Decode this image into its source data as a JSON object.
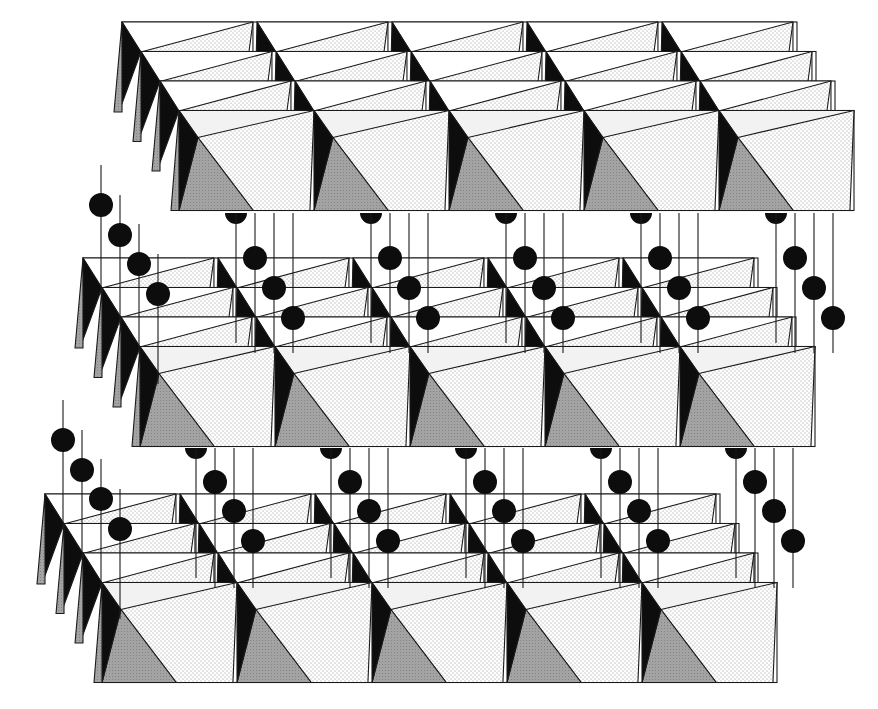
{
  "colors": {
    "background": "#ffffff",
    "outline": "#1a1a1a",
    "face_light": "#f2f2f2",
    "face_dotted_bg": "#ffffff",
    "face_dotted_dot": "#8a8a8a",
    "face_mid": "#a8a8a8",
    "face_dark": "#0d0d0d",
    "cation": "#0d0d0d"
  },
  "geometry": {
    "pitch": 135,
    "octahedra_per_row": 5,
    "rows_per_layer": 4,
    "row_offset": {
      "dx": 19,
      "dy": 29.5
    },
    "front_height": 100,
    "back_height": 30
  },
  "layers": [
    {
      "name": "top-layer",
      "origin_x": 122,
      "origin_y": 22
    },
    {
      "name": "middle-layer",
      "origin_x": 83,
      "origin_y": 258
    },
    {
      "name": "bottom-layer",
      "origin_x": 45,
      "origin_y": 494
    }
  ],
  "interlayer": [
    {
      "name": "upper-gallery",
      "top_y": 213,
      "bottom_y": 258,
      "left_posts": [
        {
          "x": 101,
          "ball_y": 205
        },
        {
          "x": 120,
          "ball_y": 235
        },
        {
          "x": 139,
          "ball_y": 264
        },
        {
          "x": 158,
          "ball_y": 294
        }
      ],
      "column_start_x": 236,
      "column_pitch": 135,
      "columns": 5,
      "ball_offsets": [
        {
          "dx": 19,
          "dy": 45
        },
        {
          "dx": 38,
          "dy": 75
        },
        {
          "dx": 57,
          "dy": 105
        }
      ]
    },
    {
      "name": "lower-gallery",
      "top_y": 448,
      "bottom_y": 494,
      "left_posts": [
        {
          "x": 63,
          "ball_y": 440
        },
        {
          "x": 82,
          "ball_y": 470
        },
        {
          "x": 101,
          "ball_y": 499
        },
        {
          "x": 120,
          "ball_y": 529
        }
      ],
      "column_start_x": 196,
      "column_pitch": 135,
      "columns": 5,
      "ball_offsets": [
        {
          "dx": 19,
          "dy": 34
        },
        {
          "dx": 38,
          "dy": 63
        },
        {
          "dx": 57,
          "dy": 93
        }
      ]
    }
  ],
  "cation_radius": 12
}
